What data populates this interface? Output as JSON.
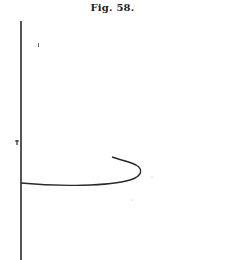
{
  "figure": {
    "caption": "Fig. 58.",
    "stroke_color": "#2a2a2a",
    "axis": {
      "x": 21,
      "y_top": 21,
      "y_bottom": 260
    },
    "curve": {
      "start": [
        21,
        183
      ],
      "description": "horizontal line from axis curving right then hooking back up-left"
    },
    "marks": [
      {
        "x": 13,
        "y": 142,
        "label": "small tick mark on axis"
      },
      {
        "x": 38,
        "y": 45,
        "label": "faint dot"
      }
    ]
  }
}
